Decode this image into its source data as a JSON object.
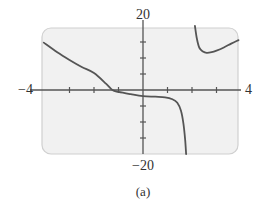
{
  "chart_data": {
    "type": "line",
    "title": "",
    "caption": "(a)",
    "xlabel": "",
    "ylabel": "",
    "xlim": [
      -4,
      4
    ],
    "ylim": [
      -20,
      20
    ],
    "x_tick_step": 1,
    "y_tick_step": 5,
    "grid": false,
    "legend": null,
    "axis_labels": {
      "x_min": "−4",
      "x_max": "4",
      "y_max": "20",
      "y_min": "−20"
    },
    "vertical_asymptote_approx": 1.9,
    "series": [
      {
        "name": "left-branch",
        "x": [
          -4.05,
          -3.5,
          -3.0,
          -2.5,
          -2.0,
          -1.5,
          -1.25,
          -1.0,
          -0.5,
          0.0,
          0.5,
          0.9,
          1.2,
          1.4,
          1.55,
          1.65,
          1.72,
          1.76
        ],
        "y": [
          14.8,
          11.8,
          9.4,
          7.2,
          5.3,
          1.9,
          0.0,
          -0.6,
          -1.3,
          -1.9,
          -2.1,
          -2.3,
          -2.9,
          -4.0,
          -6.5,
          -10.5,
          -15.5,
          -20.0
        ]
      },
      {
        "name": "right-branch",
        "x": [
          2.12,
          2.2,
          2.3,
          2.45,
          2.6,
          2.8,
          3.0,
          3.3,
          3.6,
          3.9
        ],
        "y": [
          20.0,
          16.0,
          13.2,
          12.0,
          11.6,
          11.8,
          12.3,
          13.3,
          14.5,
          15.6
        ]
      }
    ],
    "colors": {
      "curve": "#555555",
      "axis": "#555555",
      "plot_background": "#f1f1f1",
      "plot_border": "#d0d0d0"
    }
  }
}
